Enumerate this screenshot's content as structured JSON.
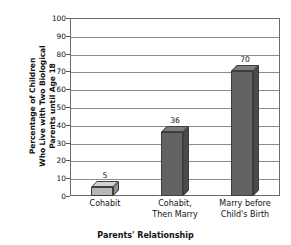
{
  "chart_data": {
    "type": "bar",
    "title": "",
    "xlabel": "Parents' Relationship",
    "ylabel": "Percentage of Children Who Live with Two Biological Parents until Age 18",
    "ylabel_lines": [
      "Percentage of Children",
      "Who Live with Two Biological",
      "Parents until Age 18"
    ],
    "categories": [
      "Cohabit",
      "Cohabit, Then Marry",
      "Marry before Child's Birth"
    ],
    "category_lines": [
      [
        "Cohabit"
      ],
      [
        "Cohabit,",
        "Then Marry"
      ],
      [
        "Marry before",
        "Child's Birth"
      ]
    ],
    "values": [
      5,
      36,
      70
    ],
    "value_labels": [
      "5",
      "36",
      "70"
    ],
    "ylim": [
      0,
      100
    ],
    "ytick_step": 10,
    "yticks": [
      100,
      90,
      80,
      70,
      60,
      50,
      40,
      30,
      20,
      10,
      0
    ],
    "ytick_labels": [
      "100",
      "90",
      "80",
      "70",
      "60",
      "50",
      "40",
      "30",
      "20",
      "10",
      "0"
    ],
    "grid": true,
    "grid_axis": "y",
    "legend": false,
    "bar_colors": [
      "#b7b7b7",
      "#636363",
      "#636363"
    ],
    "bar_top_colors": [
      "#d2d2d2",
      "#7d7d7d",
      "#7d7d7d"
    ],
    "bar_side_colors": [
      "#8f8f8f",
      "#4a4a4a",
      "#4a4a4a"
    ],
    "bar_edge_color": "#3d3d3d",
    "plot_border_color": "#6b6b6b",
    "grid_color": "#8a8a8a",
    "background_color": "#ffffff",
    "text_color": "#111111"
  }
}
